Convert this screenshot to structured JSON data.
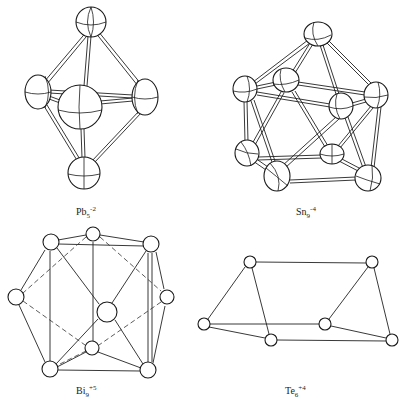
{
  "figure": {
    "panels": [
      {
        "id": "pb5",
        "label": {
          "element": "Pb",
          "subscript": "5",
          "charge": "-2"
        },
        "geometry": "trigonal bipyramid",
        "atom_count": 5
      },
      {
        "id": "sn9",
        "label": {
          "element": "Sn",
          "subscript": "9",
          "charge": "-4"
        },
        "geometry": "capped square antiprism",
        "atom_count": 9
      },
      {
        "id": "bi9",
        "label": {
          "element": "Bi",
          "subscript": "9",
          "charge": "+5"
        },
        "geometry": "tricapped trigonal prism",
        "atom_count": 9
      },
      {
        "id": "te6",
        "label": {
          "element": "Te",
          "subscript": "6",
          "charge": "+4"
        },
        "geometry": "trigonal prism",
        "atom_count": 6
      }
    ],
    "colors": {
      "line": "#1a1a1a",
      "background": "#ffffff"
    }
  }
}
